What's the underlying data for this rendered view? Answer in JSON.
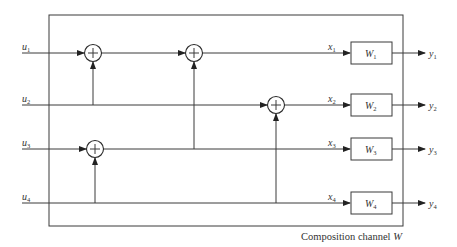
{
  "diagram": {
    "title": "Composition channel W",
    "caption_text": "Composition channel ",
    "caption_symbol": "W",
    "inputs": [
      {
        "base": "u",
        "sub": "1"
      },
      {
        "base": "u",
        "sub": "2"
      },
      {
        "base": "u",
        "sub": "3"
      },
      {
        "base": "u",
        "sub": "4"
      }
    ],
    "intermediates": [
      {
        "base": "x",
        "sub": "1"
      },
      {
        "base": "x",
        "sub": "2"
      },
      {
        "base": "x",
        "sub": "3"
      },
      {
        "base": "x",
        "sub": "4"
      }
    ],
    "channels": [
      {
        "base": "W",
        "sub": "1"
      },
      {
        "base": "W",
        "sub": "2"
      },
      {
        "base": "W",
        "sub": "3"
      },
      {
        "base": "W",
        "sub": "4"
      }
    ],
    "outputs": [
      {
        "base": "y",
        "sub": "1"
      },
      {
        "base": "y",
        "sub": "2"
      },
      {
        "base": "y",
        "sub": "3"
      },
      {
        "base": "y",
        "sub": "4"
      }
    ],
    "adders": [
      {
        "name": "adder-1",
        "symbol": "+",
        "main_line": 1,
        "from_line": 2
      },
      {
        "name": "adder-2",
        "symbol": "+",
        "main_line": 1,
        "from_line": 3
      },
      {
        "name": "adder-3",
        "symbol": "+",
        "main_line": 2,
        "from_line": 4
      },
      {
        "name": "adder-4",
        "symbol": "+",
        "main_line": 3,
        "from_line": 4
      }
    ]
  }
}
